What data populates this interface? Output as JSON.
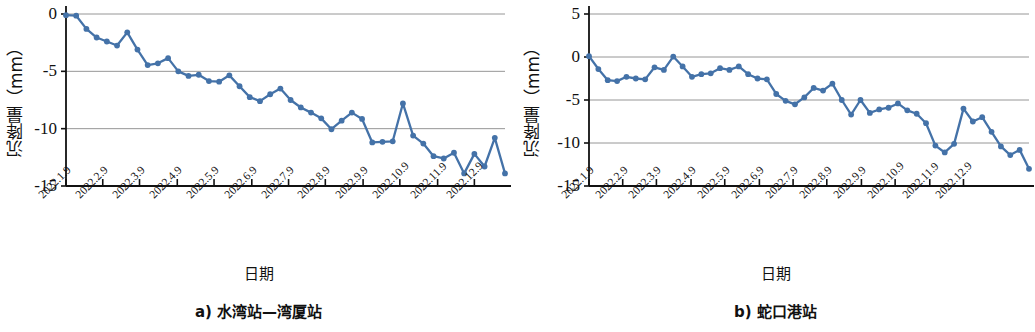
{
  "figure": {
    "background": "#ffffff",
    "series_color": "#4472a8",
    "gridline_color": "#8a8a8a",
    "axis_color": "#111111"
  },
  "panels": [
    {
      "id": "a",
      "caption": "a) 水湾站—湾厦站",
      "xaxis_title": "日期",
      "yaxis_title": "沉降量（mm）"
    },
    {
      "id": "b",
      "caption": "b) 蛇口港站",
      "xaxis_title": "日期",
      "yaxis_title": "沉降量（mm）"
    }
  ],
  "chart_data": [
    {
      "type": "line",
      "title": "a) 水湾站—湾厦站",
      "xlabel": "日期",
      "ylabel": "沉降量（mm）",
      "ylim": [
        -15,
        0
      ],
      "yticks": [
        0,
        -5,
        -10,
        -15
      ],
      "ytick_labels": [
        "0",
        "-5",
        "-10",
        "-15"
      ],
      "grid": "horizontal",
      "legend": "none",
      "xticks": [
        "2022.1.9",
        "2022.2.9",
        "2022.3.9",
        "2022.4.9",
        "2022.5.9",
        "2022.6.9",
        "2022.7.9",
        "2022.8.9",
        "2022.9.9",
        "2022.10.9",
        "2022.11.9",
        "2022.12.9"
      ],
      "xtick_positions": [
        0,
        3.6,
        7.2,
        10.9,
        14.5,
        18.2,
        21.8,
        25.4,
        29.1,
        32.7,
        36.4,
        40.0
      ],
      "n_points": 42,
      "values": [
        -0.1,
        -0.15,
        -1.3,
        -2.05,
        -2.4,
        -2.75,
        -1.6,
        -3.1,
        -4.45,
        -4.3,
        -3.85,
        -5.0,
        -5.4,
        -5.3,
        -5.85,
        -5.9,
        -5.35,
        -6.3,
        -7.25,
        -7.6,
        -7.0,
        -6.5,
        -7.5,
        -8.15,
        -8.6,
        -9.1,
        -10.05,
        -9.3,
        -8.6,
        -9.15,
        -11.2,
        -11.15,
        -11.1,
        -7.8,
        -10.6,
        -11.3,
        -12.4,
        -12.6,
        -12.1,
        -13.9,
        -12.2,
        -13.3,
        -10.8,
        -13.9
      ]
    },
    {
      "type": "line",
      "title": "b) 蛇口港站",
      "xlabel": "日期",
      "ylabel": "沉降量（mm）",
      "ylim": [
        -15,
        5
      ],
      "yticks": [
        5,
        0,
        -5,
        -10,
        -15
      ],
      "ytick_labels": [
        "5",
        "0",
        "-5",
        "-10",
        "-15"
      ],
      "grid": "horizontal",
      "legend": "none",
      "xticks": [
        "2022.1.9",
        "2022.2.9",
        "2022.3.9",
        "2022.4.9",
        "2022.5.9",
        "2022.6.9",
        "2022.7.9",
        "2022.8.9",
        "2022.9.9",
        "2022.10.9",
        "2022.11.9",
        "2022.12.9"
      ],
      "xtick_positions": [
        0,
        3.6,
        7.2,
        10.9,
        14.5,
        18.2,
        21.8,
        25.4,
        29.1,
        32.7,
        36.4,
        40.0
      ],
      "n_points": 44,
      "values": [
        0.1,
        -1.4,
        -2.7,
        -2.8,
        -2.3,
        -2.5,
        -2.6,
        -1.2,
        -1.5,
        0.05,
        -1.1,
        -2.3,
        -2.0,
        -1.9,
        -1.3,
        -1.5,
        -1.1,
        -2.0,
        -2.5,
        -2.6,
        -4.3,
        -5.1,
        -5.5,
        -4.7,
        -3.6,
        -3.9,
        -3.1,
        -5.0,
        -6.7,
        -5.0,
        -6.5,
        -6.1,
        -5.9,
        -5.4,
        -6.2,
        -6.6,
        -7.7,
        -10.3,
        -11.1,
        -10.1,
        -6.0,
        -7.5,
        -7.0,
        -8.7,
        -10.4,
        -11.4,
        -10.8,
        -13.0
      ]
    }
  ]
}
